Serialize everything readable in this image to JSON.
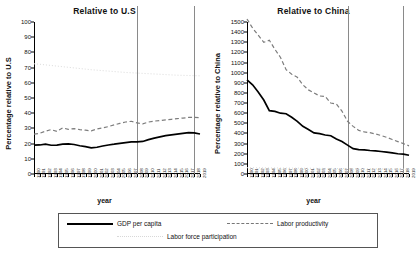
{
  "chart_data": [
    {
      "type": "line",
      "title": "Relative to U.S",
      "xlabel": "year",
      "ylabel": "Percentage relative to U.S",
      "ylim": [
        0,
        100
      ],
      "yticks": [
        0,
        10,
        20,
        30,
        40,
        50,
        60,
        70,
        80,
        90,
        100
      ],
      "grid": false,
      "legend_position": "bottom",
      "x": [
        1990,
        1991,
        1992,
        1993,
        1994,
        1995,
        1996,
        1997,
        1998,
        1999,
        2000,
        2001,
        2002,
        2003,
        2004,
        2005,
        2006,
        2007,
        2008,
        2009,
        2010,
        2011,
        2012,
        2013,
        2014,
        2015,
        2016,
        2017,
        2018,
        2019
      ],
      "vertical_reference_lines": [
        2008,
        2018
      ],
      "series": [
        {
          "name": "GDP per capita",
          "style": "solid",
          "values": [
            19.0,
            19.1,
            19.6,
            18.9,
            19.0,
            19.7,
            19.8,
            19.4,
            18.6,
            18.0,
            17.2,
            17.6,
            18.4,
            19.1,
            19.6,
            20.2,
            20.7,
            21.1,
            21.2,
            21.4,
            22.6,
            23.6,
            24.4,
            25.2,
            25.7,
            26.2,
            26.7,
            27.2,
            27.0,
            26.3
          ]
        },
        {
          "name": "Labor productivity",
          "style": "dashed",
          "values": [
            26.2,
            26.8,
            28.2,
            29.2,
            28.0,
            30.3,
            29.4,
            29.9,
            29.2,
            28.8,
            28.4,
            29.6,
            30.3,
            31.2,
            32.3,
            33.3,
            34.2,
            34.7,
            33.6,
            33.0,
            34.2,
            34.8,
            35.1,
            35.6,
            36.0,
            36.4,
            36.8,
            37.2,
            37.3,
            37.0
          ]
        },
        {
          "name": "Labor force participation",
          "style": "dotted",
          "values": [
            72.5,
            72.2,
            71.8,
            71.4,
            71.0,
            70.6,
            70.2,
            69.8,
            69.4,
            69.0,
            68.6,
            68.3,
            68.0,
            67.7,
            67.4,
            67.1,
            66.8,
            66.6,
            66.4,
            66.2,
            66.0,
            65.8,
            65.6,
            65.4,
            65.2,
            65.0,
            64.9,
            64.8,
            64.7,
            64.6
          ]
        }
      ]
    },
    {
      "type": "line",
      "title": "Relative to China",
      "xlabel": "year",
      "ylabel": "Percentage relative to China",
      "ylim": [
        0,
        1500
      ],
      "yticks": [
        0,
        100,
        200,
        300,
        400,
        500,
        600,
        700,
        800,
        900,
        1000,
        1100,
        1200,
        1300,
        1400,
        1500
      ],
      "grid": false,
      "legend_position": "bottom",
      "x": [
        1990,
        1991,
        1992,
        1993,
        1994,
        1995,
        1996,
        1997,
        1998,
        1999,
        2000,
        2001,
        2002,
        2003,
        2004,
        2005,
        2006,
        2007,
        2008,
        2009,
        2010,
        2011,
        2012,
        2013,
        2014,
        2015,
        2016,
        2017,
        2018,
        2019
      ],
      "vertical_reference_lines": [
        2008,
        2018
      ],
      "series": [
        {
          "name": "GDP per capita",
          "style": "solid",
          "values": [
            930,
            880,
            810,
            730,
            625,
            618,
            600,
            595,
            560,
            520,
            470,
            440,
            405,
            398,
            385,
            378,
            345,
            320,
            285,
            250,
            240,
            238,
            232,
            228,
            222,
            215,
            208,
            200,
            196,
            185
          ]
        },
        {
          "name": "Labor productivity",
          "style": "dashed",
          "values": [
            1530,
            1440,
            1370,
            1300,
            1320,
            1230,
            1150,
            1030,
            985,
            955,
            880,
            830,
            800,
            770,
            765,
            700,
            690,
            620,
            520,
            470,
            430,
            415,
            408,
            395,
            380,
            362,
            340,
            320,
            300,
            278
          ]
        },
        {
          "name": "Labor force participation",
          "style": "dotted",
          "values": [
            62,
            62,
            61,
            61,
            60,
            60,
            59,
            59,
            58,
            58,
            57,
            57,
            56,
            56,
            55,
            55,
            54,
            54,
            53,
            53,
            52,
            52,
            51,
            51,
            50,
            50,
            49,
            49,
            48,
            48
          ]
        }
      ]
    }
  ],
  "legend": {
    "gdp_label": "GDP per capita",
    "productivity_label": "Labor productivity",
    "lfp_label": "Labor force participation"
  }
}
